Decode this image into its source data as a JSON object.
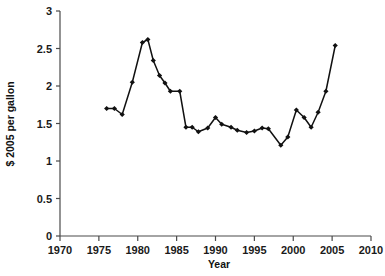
{
  "chart_data": {
    "type": "line",
    "title": "",
    "subtitle": "",
    "xlabel": "Year",
    "ylabel": "$ 2005 per gallon",
    "xlim": [
      1970,
      2010
    ],
    "ylim": [
      0,
      3
    ],
    "grid": false,
    "legend": null,
    "marker": "diamond",
    "line_color": "#111111",
    "marker_color": "#111111",
    "axis_color": "#4a4a4a",
    "background": "#ffffff",
    "xticks": [
      1970,
      1975,
      1980,
      1985,
      1990,
      1995,
      2000,
      2005,
      2010
    ],
    "xtick_labels": [
      "1970",
      "1975",
      "1980",
      "1985",
      "1990",
      "1995",
      "2000",
      "2005",
      "2010"
    ],
    "yticks": [
      0,
      0.5,
      1,
      1.5,
      2,
      2.5,
      3
    ],
    "ytick_labels": [
      "0",
      "0.5",
      "1",
      "1.5",
      "2",
      "2.5",
      "3"
    ],
    "series": [
      {
        "name": "Gasoline price",
        "x": [
          1976.0,
          1977.0,
          1978.0,
          1979.3,
          1980.6,
          1981.3,
          1982.0,
          1982.8,
          1983.5,
          1984.2,
          1985.4,
          1986.2,
          1987.0,
          1987.8,
          1989.0,
          1990.0,
          1990.8,
          1992.0,
          1992.8,
          1994.0,
          1995.0,
          1996.0,
          1996.8,
          1998.4,
          1999.3,
          2000.4,
          2001.4,
          2002.3,
          2003.2,
          2004.2,
          2005.4
        ],
        "y": [
          1.7,
          1.7,
          1.62,
          2.05,
          2.58,
          2.62,
          2.34,
          2.14,
          2.04,
          1.93,
          1.93,
          1.45,
          1.45,
          1.39,
          1.44,
          1.58,
          1.49,
          1.45,
          1.41,
          1.38,
          1.4,
          1.44,
          1.43,
          1.21,
          1.32,
          1.68,
          1.58,
          1.45,
          1.65,
          1.93,
          2.54
        ]
      }
    ]
  },
  "axes": {
    "x_title": "Year",
    "y_title": "$ 2005 per gallon"
  }
}
